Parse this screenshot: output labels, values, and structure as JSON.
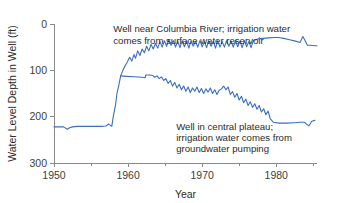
{
  "chart_data": {
    "type": "line",
    "title": "",
    "xlabel": "Year",
    "ylabel": "Water Level Depth in Well (ft)",
    "xlim": [
      1950,
      1985.5
    ],
    "ylim": [
      300,
      0
    ],
    "y_inverted": true,
    "grid": false,
    "legend_position": "none",
    "xticks": [
      1950,
      1960,
      1970,
      1980
    ],
    "xtick_labels": [
      "1950",
      "1960",
      "1970",
      "1980"
    ],
    "xminor_ticks": [
      1955,
      1965,
      1975,
      1985
    ],
    "yticks": [
      0,
      100,
      200,
      300
    ],
    "ytick_labels": [
      "0",
      "100",
      "200",
      "300"
    ],
    "line_color": "#3a6ec0",
    "series": [
      {
        "name": "Well near Columbia River",
        "color": "#3a6ec0",
        "x": [
          1950,
          1950.6,
          1951.3,
          1951.8,
          1952.1,
          1952.5,
          1953.2,
          1954.0,
          1954.8,
          1955.6,
          1956.4,
          1957.0,
          1957.4,
          1957.8,
          1958.0,
          1958.3,
          1958.5,
          1958.8,
          1959.0,
          1959.3,
          1959.6,
          1959.9,
          1960.2,
          1960.5,
          1960.8,
          1961.0,
          1961.3,
          1961.6,
          1961.9,
          1962.2,
          1962.5,
          1962.8,
          1963.1,
          1963.4,
          1963.7,
          1964.0,
          1964.3,
          1964.6,
          1964.9,
          1965.2,
          1965.5,
          1965.8,
          1966.1,
          1966.4,
          1966.7,
          1967.0,
          1967.3,
          1967.6,
          1967.9,
          1968.2,
          1968.5,
          1968.8,
          1969.1,
          1969.4,
          1969.7,
          1970.0,
          1970.3,
          1970.6,
          1970.9,
          1971.2,
          1971.5,
          1971.8,
          1972.1,
          1972.4,
          1972.7,
          1973.0,
          1973.3,
          1973.6,
          1973.9,
          1974.2,
          1974.5,
          1974.8,
          1975.1,
          1975.4,
          1975.7,
          1976.0,
          1976.3,
          1976.6,
          1976.9,
          1977.2,
          1977.6,
          1978.2,
          1979.0,
          1979.8,
          1980.3,
          1981.0,
          1981.8,
          1982.6,
          1983.2,
          1983.6,
          1983.9,
          1984.2,
          1984.6,
          1985.2,
          1985.5
        ],
        "y": [
          222,
          222,
          222,
          227,
          224,
          222,
          221,
          221,
          221,
          221,
          221,
          220,
          216,
          221,
          200,
          175,
          150,
          128,
          112,
          100,
          90,
          82,
          72,
          80,
          66,
          74,
          58,
          68,
          54,
          62,
          48,
          58,
          44,
          54,
          42,
          52,
          38,
          50,
          36,
          48,
          34,
          46,
          36,
          50,
          37,
          51,
          36,
          49,
          37,
          52,
          36,
          48,
          37,
          50,
          36,
          49,
          38,
          51,
          36,
          48,
          37,
          52,
          36,
          50,
          38,
          50,
          36,
          48,
          37,
          50,
          36,
          49,
          37,
          51,
          36,
          49,
          38,
          51,
          36,
          34,
          32,
          31,
          30,
          29,
          29,
          31,
          34,
          37,
          40,
          27,
          36,
          46,
          46,
          47,
          47
        ],
        "annotation": {
          "text_lines": [
            "Well near Columbia River; irrigation water",
            "comes from surface water reservoir"
          ],
          "x": 1958.0,
          "y": 18
        }
      },
      {
        "name": "Well in central plateau",
        "color": "#3a6ec0",
        "x": [
          1959.0,
          1959.8,
          1960.8,
          1961.8,
          1962.3,
          1962.4,
          1962.9,
          1963.3,
          1963.6,
          1963.9,
          1964.2,
          1964.5,
          1964.8,
          1965.1,
          1965.4,
          1965.7,
          1966.0,
          1966.3,
          1966.6,
          1966.9,
          1967.2,
          1967.5,
          1967.8,
          1968.1,
          1968.4,
          1968.7,
          1969.0,
          1969.3,
          1969.6,
          1969.9,
          1970.2,
          1970.5,
          1970.8,
          1971.1,
          1971.4,
          1971.7,
          1972.0,
          1972.3,
          1972.6,
          1972.9,
          1973.2,
          1973.5,
          1973.8,
          1974.1,
          1974.4,
          1974.7,
          1975.0,
          1975.3,
          1975.6,
          1975.9,
          1976.2,
          1976.5,
          1976.8,
          1977.1,
          1977.4,
          1977.7,
          1978.0,
          1978.3,
          1978.6,
          1978.9,
          1979.2,
          1979.6,
          1980.4,
          1981.4,
          1982.4,
          1983.2,
          1983.8,
          1984.1,
          1984.4,
          1984.8,
          1985.2
        ],
        "y": [
          112,
          113,
          114,
          115,
          116,
          110,
          110,
          111,
          115,
          112,
          118,
          114,
          122,
          118,
          128,
          122,
          134,
          126,
          138,
          130,
          142,
          134,
          145,
          136,
          148,
          138,
          145,
          136,
          148,
          139,
          150,
          140,
          147,
          138,
          150,
          142,
          152,
          143,
          140,
          134,
          142,
          136,
          152,
          146,
          158,
          150,
          164,
          156,
          170,
          162,
          176,
          168,
          180,
          172,
          184,
          176,
          190,
          183,
          196,
          188,
          205,
          212,
          214,
          214,
          213,
          212,
          212,
          216,
          220,
          210,
          208
        ],
        "annotation": {
          "text_lines": [
            "Well in central plateau;",
            "irrigation water comes from",
            "groundwater pumping"
          ],
          "x": 1966.5,
          "y": 228
        }
      }
    ]
  }
}
